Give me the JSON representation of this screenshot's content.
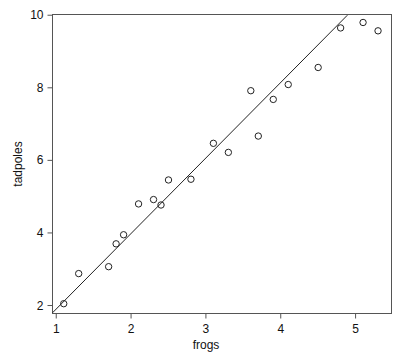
{
  "chart_data": {
    "type": "scatter",
    "title": "",
    "xlabel": "frogs",
    "ylabel": "tadpoles",
    "xlim": [
      0.95,
      5.48
    ],
    "ylim": [
      1.78,
      10.02
    ],
    "xticks": [
      1,
      2,
      3,
      4,
      5
    ],
    "yticks": [
      2,
      4,
      6,
      8,
      10
    ],
    "xtick_labels": [
      "1",
      "2",
      "3",
      "4",
      "5"
    ],
    "ytick_labels": [
      "2",
      "4",
      "6",
      "8",
      "10"
    ],
    "grid": false,
    "legend": null,
    "marker": "open-circle",
    "marker_color": "#222222",
    "line_color": "#222222",
    "axis_color": "#444444",
    "background": "#ffffff",
    "points": [
      {
        "x": 1.1,
        "y": 2.05
      },
      {
        "x": 1.3,
        "y": 2.88
      },
      {
        "x": 1.7,
        "y": 3.07
      },
      {
        "x": 1.8,
        "y": 3.7
      },
      {
        "x": 1.9,
        "y": 3.95
      },
      {
        "x": 2.1,
        "y": 4.8
      },
      {
        "x": 2.3,
        "y": 4.92
      },
      {
        "x": 2.4,
        "y": 4.77
      },
      {
        "x": 2.5,
        "y": 5.46
      },
      {
        "x": 2.8,
        "y": 5.48
      },
      {
        "x": 3.1,
        "y": 6.47
      },
      {
        "x": 3.3,
        "y": 6.22
      },
      {
        "x": 3.6,
        "y": 7.92
      },
      {
        "x": 3.7,
        "y": 6.67
      },
      {
        "x": 3.9,
        "y": 7.68
      },
      {
        "x": 4.1,
        "y": 8.09
      },
      {
        "x": 4.5,
        "y": 8.56
      },
      {
        "x": 4.8,
        "y": 9.65
      },
      {
        "x": 5.1,
        "y": 9.8
      },
      {
        "x": 5.3,
        "y": 9.57
      }
    ],
    "fit_line": {
      "slope": 2.105,
      "intercept": -0.2,
      "x_start": 0.95,
      "x_end": 4.89,
      "y_start": 1.8,
      "y_end": 10.0
    }
  }
}
